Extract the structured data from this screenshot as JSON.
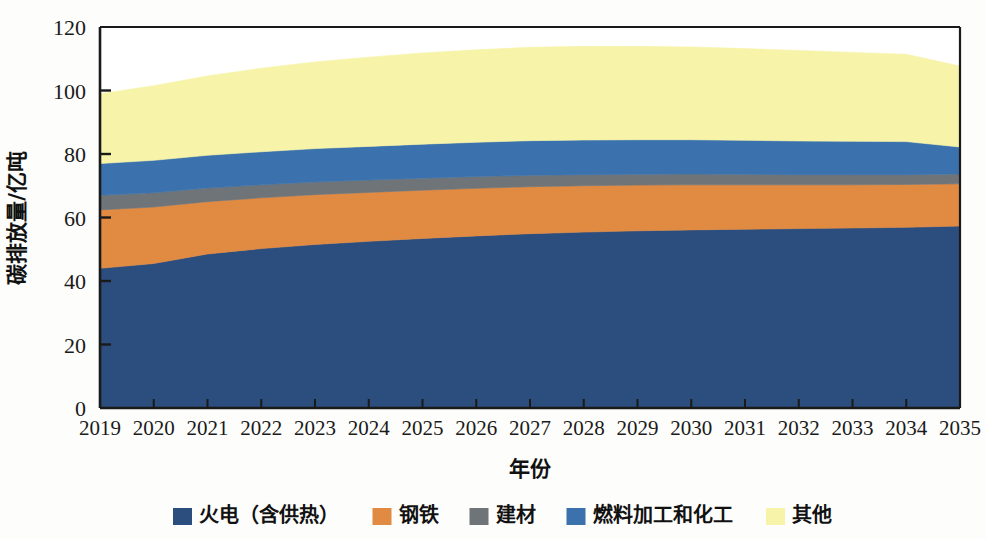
{
  "chart_data": {
    "type": "area",
    "stacked": true,
    "title": "",
    "xlabel": "年份",
    "ylabel": "碳排放量/亿吨",
    "x": [
      2019,
      2020,
      2021,
      2022,
      2023,
      2024,
      2025,
      2026,
      2027,
      2028,
      2029,
      2030,
      2031,
      2032,
      2033,
      2034,
      2035
    ],
    "xtick_labels": [
      "2019",
      "2020",
      "2021",
      "2022",
      "2023",
      "2024",
      "2025",
      "2026",
      "2027",
      "2028",
      "2029",
      "2030",
      "2031",
      "2032",
      "2033",
      "2034",
      "2035"
    ],
    "ytick_labels": [
      "0",
      "20",
      "40",
      "60",
      "80",
      "100",
      "120"
    ],
    "yticks": [
      0,
      20,
      40,
      60,
      80,
      100,
      120
    ],
    "ylim": [
      0,
      120
    ],
    "xlim": [
      2019,
      2035
    ],
    "grid": false,
    "legend_position": "bottom",
    "series": [
      {
        "name": "火电（含供热）",
        "color": "#2B4E7E",
        "values": [
          44.0,
          45.5,
          48.5,
          50.2,
          51.5,
          52.5,
          53.4,
          54.2,
          54.9,
          55.4,
          55.8,
          56.1,
          56.3,
          56.5,
          56.7,
          56.9,
          57.3
        ]
      },
      {
        "name": "钢铁",
        "color": "#E08A42",
        "values": [
          18.4,
          17.8,
          16.5,
          16.0,
          15.7,
          15.4,
          15.2,
          15.0,
          14.8,
          14.6,
          14.4,
          14.2,
          14.0,
          13.8,
          13.6,
          13.5,
          13.3
        ]
      },
      {
        "name": "建材",
        "color": "#6E7478",
        "values": [
          4.6,
          4.5,
          4.3,
          4.1,
          4.0,
          3.9,
          3.8,
          3.7,
          3.6,
          3.5,
          3.4,
          3.4,
          3.3,
          3.2,
          3.2,
          3.1,
          3.1
        ]
      },
      {
        "name": "燃料加工和化工",
        "color": "#3B72AD",
        "values": [
          10.0,
          10.2,
          10.3,
          10.4,
          10.5,
          10.6,
          10.7,
          10.8,
          10.9,
          10.9,
          10.9,
          10.8,
          10.7,
          10.6,
          10.5,
          10.4,
          8.5
        ]
      },
      {
        "name": "其他",
        "color": "#F7F3A8",
        "values": [
          22.0,
          23.5,
          25.0,
          26.3,
          27.3,
          28.1,
          28.7,
          29.1,
          29.4,
          29.5,
          29.4,
          29.2,
          28.9,
          28.5,
          28.0,
          27.5,
          25.5
        ]
      }
    ],
    "totals": [
      99.0,
      101.5,
      104.6,
      107.0,
      109.0,
      110.5,
      111.8,
      112.8,
      113.6,
      113.9,
      113.9,
      113.7,
      113.2,
      112.6,
      112.0,
      111.4,
      107.7
    ]
  },
  "axis": {
    "y_title": "碳排放量/亿吨",
    "x_title": "年份"
  }
}
